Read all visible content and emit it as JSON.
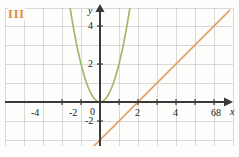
{
  "figure": {
    "label": "III",
    "label_color": "#e08a3c",
    "background": "#fdfdfb"
  },
  "chart_data": {
    "type": "line",
    "title": "",
    "xlabel": "x",
    "ylabel": "y",
    "xlim": [
      -5.2,
      8.6
    ],
    "ylim": [
      -2.8,
      5.2
    ],
    "xticks": [
      -4,
      -2,
      0,
      2,
      4,
      6,
      8
    ],
    "xtick_labels": [
      "-4",
      "-2",
      "0",
      "2",
      "4",
      "6",
      "8"
    ],
    "yticks": [
      -2,
      2,
      4
    ],
    "ytick_labels": [
      "-2",
      "2",
      "4"
    ],
    "grid": true,
    "grid_step": 1,
    "grid_color": "#c9c9c9",
    "axis_color": "#3a3a38",
    "legend": "none",
    "series": [
      {
        "name": "parabola",
        "type": "parabola",
        "equation": "y = 2x^2",
        "color": "#9fba6c",
        "a": 2,
        "h": 0,
        "k": 0,
        "x_from": -1.62,
        "x_to": 1.62
      },
      {
        "name": "line",
        "type": "line",
        "equation": "y = x - 2",
        "color": "#e2a26a",
        "slope": 1,
        "intercept": -2,
        "x_from": -0.75,
        "x_to": 7.9
      }
    ]
  },
  "labels": {
    "x_axis_name": "x",
    "y_axis_name": "y",
    "x": {
      "n4": "-4",
      "n2": "-2",
      "zero": "0",
      "p2": "2",
      "p4": "4",
      "p6": "6",
      "p8": "8"
    },
    "y": {
      "p4": "4",
      "p2": "2",
      "n2": "-2"
    }
  }
}
